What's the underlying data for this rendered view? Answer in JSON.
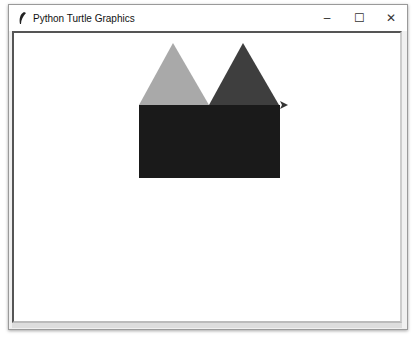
{
  "window": {
    "title": "Python Turtle Graphics",
    "icon": "feather-icon",
    "controls": {
      "minimize": "–",
      "maximize": "☐",
      "close": "✕"
    }
  },
  "canvas": {
    "background": "#ffffff",
    "shapes": [
      {
        "type": "triangle",
        "fill": "#a9a9a9",
        "points": "139,105 173,43 209,105"
      },
      {
        "type": "triangle",
        "fill": "#3e3e3e",
        "points": "209,105 243,43 279,105"
      },
      {
        "type": "rectangle",
        "fill": "#1a1a1a",
        "x": 139,
        "y": 105,
        "width": 141,
        "height": 73
      }
    ],
    "turtle": {
      "x": 283,
      "y": 105,
      "heading": "east",
      "color": "#333333"
    }
  }
}
